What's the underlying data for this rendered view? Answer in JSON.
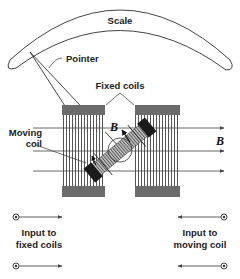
{
  "diagram": {
    "labels": {
      "scale": "Scale",
      "pointer": "Pointer",
      "fixed_coils": "Fixed coils",
      "moving_coil_line1": "Moving",
      "moving_coil_line2": "coil",
      "field_b_moving": "B",
      "field_b_fixed": "B",
      "input_fixed_line1": "Input to",
      "input_fixed_line2": "fixed coils",
      "input_moving_line1": "Input to",
      "input_moving_line2": "moving coil"
    },
    "components": [
      {
        "name": "scale-arc",
        "type": "curved scale"
      },
      {
        "name": "pointer",
        "type": "needle"
      },
      {
        "name": "fixed-coil-left",
        "type": "coil"
      },
      {
        "name": "fixed-coil-right",
        "type": "coil"
      },
      {
        "name": "moving-coil",
        "type": "rotating coil"
      },
      {
        "name": "field-lines",
        "count": 3,
        "direction": "left-to-right"
      },
      {
        "name": "terminals-fixed",
        "count": 2,
        "side": "left"
      },
      {
        "name": "terminals-moving",
        "count": 2,
        "side": "right"
      }
    ],
    "colors": {
      "line": "#333333",
      "coil_band": "#6b6b6b",
      "coil_stripe": "#555555",
      "moving_coil_end": "#1a1a1a",
      "moving_coil_body": "#9a9a9a"
    }
  }
}
